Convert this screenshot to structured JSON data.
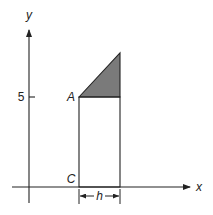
{
  "figure": {
    "axes": {
      "x_label": "x",
      "y_label": "y",
      "y_tick_label": "5"
    },
    "points": {
      "A": "A",
      "C": "C"
    },
    "dimension": {
      "label": "h"
    },
    "colors": {
      "stroke": "#222222",
      "shaded": "#7a7a7a",
      "background": "#ffffff"
    }
  }
}
